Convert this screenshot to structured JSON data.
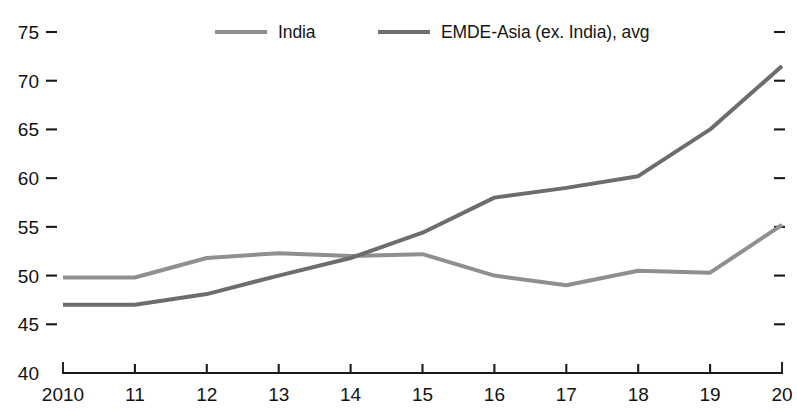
{
  "chart_data": {
    "type": "line",
    "title": "",
    "xlabel": "",
    "ylabel": "",
    "x": [
      "2010",
      "11",
      "12",
      "13",
      "14",
      "15",
      "16",
      "17",
      "18",
      "19",
      "20"
    ],
    "xtick_labels": [
      "2010",
      "11",
      "12",
      "13",
      "14",
      "15",
      "16",
      "17",
      "18",
      "19",
      "20"
    ],
    "ytick_labels": [
      "40",
      "45",
      "50",
      "55",
      "60",
      "65",
      "70",
      "75"
    ],
    "yticks": [
      40,
      45,
      50,
      55,
      60,
      65,
      70,
      75
    ],
    "ylim": [
      40,
      76.5
    ],
    "xlim": [
      2010,
      2020
    ],
    "grid": false,
    "right_axis_ticks": true,
    "right_axis_labels": false,
    "legend_position": "top-center",
    "series": [
      {
        "name": "India",
        "color": "#8f8f8f",
        "line_width": 4.0,
        "values": [
          49.8,
          49.8,
          51.8,
          52.3,
          52.0,
          52.2,
          50.0,
          49.0,
          50.5,
          50.3,
          55.2
        ]
      },
      {
        "name": "EMDE-Asia (ex. India), avg",
        "color": "#6d6d6d",
        "line_width": 4.0,
        "values": [
          47.0,
          47.0,
          48.1,
          50.0,
          51.8,
          54.4,
          58.0,
          59.0,
          60.2,
          65.0,
          71.5
        ]
      }
    ]
  },
  "legend": {
    "items": [
      {
        "label": "India",
        "color": "#8f8f8f"
      },
      {
        "label": "EMDE-Asia (ex. India), avg",
        "color": "#6d6d6d"
      }
    ]
  },
  "axes": {
    "y": {
      "labels": [
        "75",
        "70",
        "65",
        "60",
        "55",
        "50",
        "45",
        "40"
      ]
    },
    "x": {
      "labels": [
        "2010",
        "11",
        "12",
        "13",
        "14",
        "15",
        "16",
        "17",
        "18",
        "19",
        "20"
      ]
    }
  }
}
